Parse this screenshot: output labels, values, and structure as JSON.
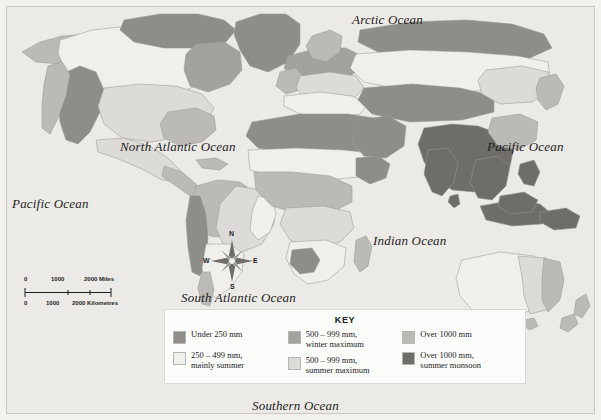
{
  "map": {
    "title": "World Precipitation Map",
    "projection": "world",
    "background_color": "#f2f1ee",
    "ocean_color": "#eceae6",
    "ocean_labels": [
      {
        "name": "arctic-ocean",
        "text": "Arctic Ocean"
      },
      {
        "name": "north-atlantic-ocean",
        "text": "North Atlantic Ocean"
      },
      {
        "name": "pacific-ocean-west",
        "text": "Pacific Ocean"
      },
      {
        "name": "pacific-ocean-east",
        "text": "Pacific Ocean"
      },
      {
        "name": "indian-ocean",
        "text": "Indian Ocean"
      },
      {
        "name": "south-atlantic-ocean",
        "text": "South Atlantic Ocean"
      },
      {
        "name": "southern-ocean",
        "text": "Southern Ocean"
      }
    ]
  },
  "scale_bar": {
    "miles": {
      "ticks": [
        "0",
        "1000",
        "2000"
      ],
      "unit": "Miles"
    },
    "kilometres": {
      "ticks": [
        "0",
        "1000",
        "2000"
      ],
      "unit": "Kilometres"
    },
    "miles_label": "2000 Miles",
    "km_label": "2000 Kilometres"
  },
  "compass": {
    "north": "N",
    "south": "S",
    "east": "E",
    "west": "W"
  },
  "key": {
    "title": "KEY",
    "columns": [
      [
        {
          "label": "Under 250 mm",
          "color": "#8e8d89"
        },
        {
          "label": "250 – 499 mm,\nmainly summer",
          "color": "#f0efec"
        }
      ],
      [
        {
          "label": "500 – 999 mm,\nwinter maximum",
          "color": "#a3a29e"
        },
        {
          "label": "500 – 999 mm,\nsummer maximum",
          "color": "#dcdbd7"
        }
      ],
      [
        {
          "label": "Over 1000 mm",
          "color": "#bbbab6"
        },
        {
          "label": "Over 1000 mm,\nsummer monsoon",
          "color": "#6e6d69"
        }
      ]
    ]
  },
  "legend_colors": {
    "under_250": "#8e8d89",
    "mm_250_499_mainly_summer": "#f0efec",
    "mm_500_999_winter_max": "#a3a29e",
    "mm_500_999_summer_max": "#dcdbd7",
    "over_1000": "#bbbab6",
    "over_1000_summer_monsoon": "#6e6d69",
    "outline": "#9a9995",
    "ocean": "#eceae6",
    "page": "#f2f1ee"
  }
}
